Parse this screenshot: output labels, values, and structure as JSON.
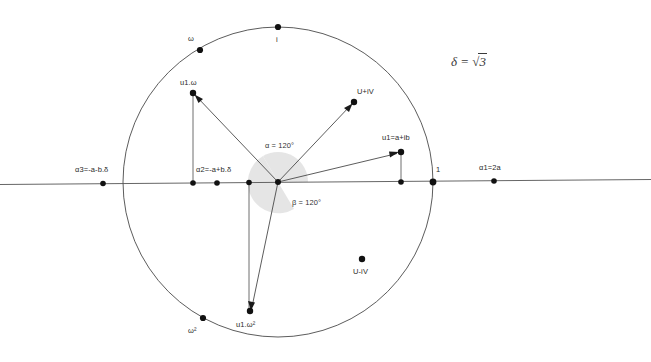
{
  "diagram": {
    "background_color": "#ffffff",
    "stroke_color": "#4a4a4a",
    "dot_color": "#1a1a1a",
    "arc_fill_color": "#e2e2e2",
    "formula": {
      "lhs": "δ",
      "eq": "=",
      "radical": "√",
      "radicand": "3",
      "full": "δ = √3"
    },
    "angles": [
      {
        "id": "alpha",
        "label": "α = 120°",
        "value": 120,
        "unit": "degrees"
      },
      {
        "id": "beta",
        "label": "β = 120°",
        "value": 120,
        "unit": "degrees"
      }
    ],
    "circle": {
      "cx": 278,
      "cy": 182,
      "r": 155
    },
    "points": [
      {
        "id": "i",
        "label": "i",
        "x": 278,
        "y": 27
      },
      {
        "id": "omega",
        "label": "ω",
        "x": 200,
        "y": 50
      },
      {
        "id": "omega2",
        "label": "ω²",
        "x": 203,
        "y": 318
      },
      {
        "id": "one",
        "label": "1",
        "x": 433,
        "y": 182
      },
      {
        "id": "alpha1",
        "label": "α1=2a",
        "x": 494,
        "y": 182
      },
      {
        "id": "alpha2",
        "label": "α2=-a+b.δ",
        "x": 217,
        "y": 182
      },
      {
        "id": "alpha3",
        "label": "α3=-a-b.δ",
        "x": 103,
        "y": 182
      },
      {
        "id": "u1",
        "label": "u1=a+ib",
        "x": 401,
        "y": 152
      },
      {
        "id": "u1omega",
        "label": "u1.ω",
        "x": 193,
        "y": 93
      },
      {
        "id": "u1omega2",
        "label": "u1.ω²",
        "x": 250,
        "y": 311
      },
      {
        "id": "UplusiV",
        "label": "U+iV",
        "x": 354,
        "y": 102
      },
      {
        "id": "UminusiV",
        "label": "U-iV",
        "x": 362,
        "y": 259
      },
      {
        "id": "foot_u1",
        "label": "",
        "x": 401,
        "y": 182
      },
      {
        "id": "foot_u1w",
        "label": "",
        "x": 193,
        "y": 182
      },
      {
        "id": "foot_u1w2",
        "label": "",
        "x": 249,
        "y": 182
      },
      {
        "id": "origin",
        "label": "",
        "x": 278,
        "y": 182
      }
    ],
    "vectors": [
      {
        "id": "vec-u1",
        "from": "origin",
        "to": "u1",
        "arrow": true
      },
      {
        "id": "vec-u1omega",
        "from": "origin",
        "to": "u1omega",
        "arrow": true
      },
      {
        "id": "vec-u1omega2",
        "from": "origin",
        "to": "u1omega2",
        "arrow": true
      },
      {
        "id": "vec-UplusiV",
        "from": "origin",
        "to": "UplusiV",
        "arrow": true
      }
    ],
    "drop_lines": [
      {
        "id": "drop-u1",
        "from": "u1",
        "to": "foot_u1"
      },
      {
        "id": "drop-u1omega",
        "from": "u1omega",
        "to": "foot_u1w"
      },
      {
        "id": "drop-u1omega2",
        "from": "u1omega2",
        "to": "foot_u1w2"
      }
    ],
    "axis": {
      "label": "real-axis",
      "x1": 0,
      "y1": 184,
      "x2": 651,
      "y2": 180
    }
  }
}
